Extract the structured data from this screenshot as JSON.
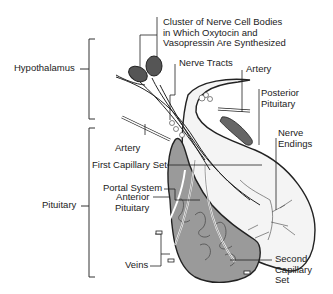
{
  "diagram": {
    "groups": {
      "hypothalamus": "Hypothalamus",
      "pituitary": "Pituitary"
    },
    "labels": {
      "cluster_line1": "Cluster of Nerve Cell Bodies",
      "cluster_line2": "in Which Oxytocin and",
      "cluster_line3": "Vasopressin Are Synthesized",
      "nerve_tracts": "Nerve Tracts",
      "artery_top": "Artery",
      "posterior_line1": "Posterior",
      "posterior_line2": "Pituitary",
      "nerve_endings_line1": "Nerve",
      "nerve_endings_line2": "Endings",
      "artery_left": "Artery",
      "first_capillary": "First Capillary Set",
      "portal_system": "Portal System",
      "anterior_line1": "Anterior",
      "anterior_line2": "Pituitary",
      "veins": "Veins",
      "second_line1": "Second",
      "second_line2": "Capillary",
      "second_line3": "Set"
    },
    "colors": {
      "ink": "#222222",
      "anterior_fill": "#9a9a9a",
      "posterior_fill": "#f4f4f4",
      "cell_body": "#555555"
    }
  }
}
